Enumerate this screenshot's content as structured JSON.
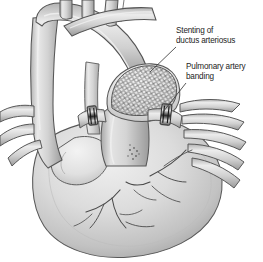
{
  "figure": {
    "kind": "medical-illustration",
    "style": "grayscale pencil / airbrush anatomical drawing",
    "background_color": "#ffffff",
    "ink_color": "#3a3a3a",
    "tissue_light": "#e8e8e8",
    "tissue_mid": "#c9c9c9",
    "tissue_dark": "#9a9a9a",
    "tissue_shadow": "#6f6f6f",
    "band_color": "#2b2b2b",
    "stent_color": "#5a5a5a",
    "label_color": "#242424"
  },
  "annotations": [
    {
      "id": "stenting-of-ductus-arteriosus",
      "line1": "Stenting of",
      "line2": "ductus arteriosus",
      "text": "Stenting of\nductus arteriosus",
      "leader_from": {
        "x": 176,
        "y": 47
      },
      "leader_to": {
        "x": 150,
        "y": 72
      }
    },
    {
      "id": "pulmonary-artery-banding",
      "line1": "Pulmonary artery",
      "line2": "banding",
      "text": "Pulmonary artery\nbanding",
      "leader_from": {
        "x": 186,
        "y": 83
      },
      "leader_to": {
        "x": 163,
        "y": 112
      }
    }
  ],
  "structures": {
    "aortic_arch": "aortic-arch",
    "descending_aorta": "descending-aorta",
    "brachiocephalic_vessels": "brachiocephalic-vessels",
    "main_pulmonary_artery": "main-pulmonary-artery",
    "left_pulmonary_artery": "left-pulmonary-artery",
    "right_pulmonary_artery": "right-pulmonary-artery",
    "pulmonary_veins_right": "right-pulmonary-veins",
    "pulmonary_veins_left": "left-pulmonary-veins",
    "ventricular_mass": "ventricular-mass",
    "left_atrial_appendage": "left-atrial-appendage",
    "coronary_arteries": "coronary-arteries",
    "ductal_stent": "ductal-stent-mesh",
    "band_left": "pulmonary-artery-band-left",
    "band_right": "pulmonary-artery-band-right",
    "stipple_marking": "epicardial-stipple-marking"
  }
}
